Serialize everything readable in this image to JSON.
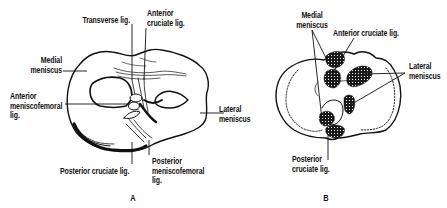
{
  "figure_a": {
    "panel_label": "A",
    "labels": {
      "transverse_lig": "Transverse lig.",
      "anterior_cruciate_1": "Anterior",
      "anterior_cruciate_2": "cruciate lig.",
      "medial_meniscus_1": "Medial",
      "medial_meniscus_2": "meniscus",
      "anterior_mf_1": "Anterior",
      "anterior_mf_2": "meniscofemoral",
      "anterior_mf_3": "lig.",
      "lateral_meniscus_1": "Lateral",
      "lateral_meniscus_2": "meniscus",
      "posterior_cruciate": "Posterior cruciate lig.",
      "posterior_mf_1": "Posterior",
      "posterior_mf_2": "meniscofemoral",
      "posterior_mf_3": "lig."
    }
  },
  "figure_b": {
    "panel_label": "B",
    "labels": {
      "medial_meniscus_1": "Medial",
      "medial_meniscus_2": "meniscus",
      "anterior_cruciate": "Anterior cruciate lig.",
      "lateral_meniscus_1": "Lateral",
      "lateral_meniscus_2": "meniscus",
      "posterior_cruciate_1": "Posterior",
      "posterior_cruciate_2": "cruciate lig."
    }
  }
}
